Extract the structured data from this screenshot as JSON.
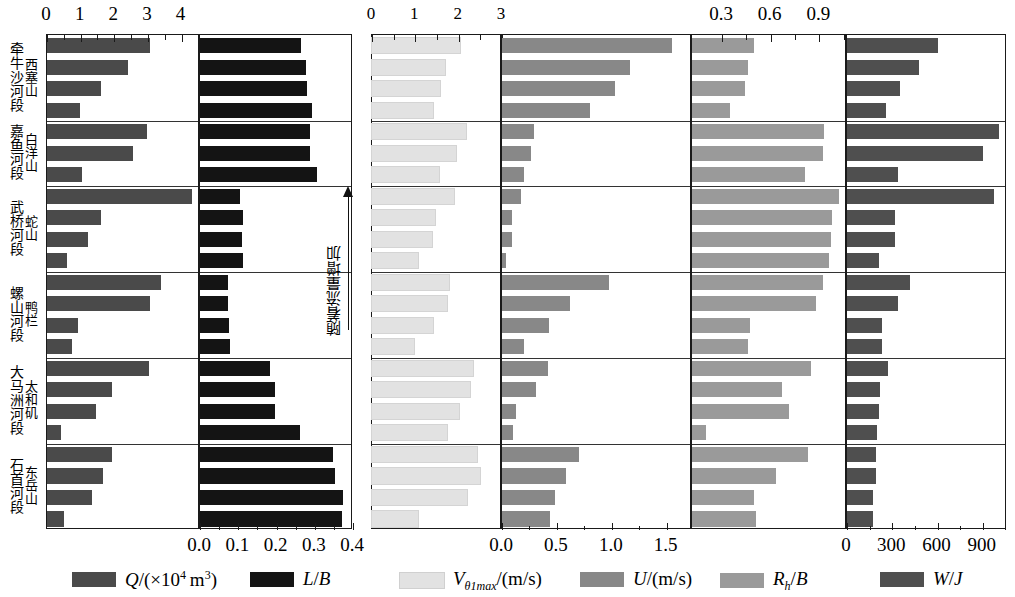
{
  "chart_data": {
    "type": "bar",
    "orientation": "horizontal",
    "title": "",
    "layout": "6 panels side-by-side sharing 6 reach row-groups; 23 discharge-level rows total",
    "grid": false,
    "legend_position": "bottom",
    "annotation": {
      "text": "随着流量增加",
      "meaning": "with increasing discharge",
      "arrow": "up"
    },
    "groups": [
      {
        "reach": "牯牛沙河段",
        "station": "西塞山",
        "rows": 4
      },
      {
        "reach": "嘲广河段",
        "station": "白洋山",
        "rows": 3
      },
      {
        "reach": "武桥河段",
        "station": "蛇山",
        "rows": 4
      },
      {
        "reach": "螺山河段",
        "station": "鸭栏",
        "rows": 4
      },
      {
        "reach": "大马洲河段",
        "station": "太和矶",
        "rows": 4
      },
      {
        "reach": "石首河段",
        "station": "东岳山",
        "rows": 4
      }
    ],
    "panels": [
      {
        "id": "Q",
        "legend": "Q/(×10^4 m^3)",
        "axis_side": "top",
        "ticks": [
          0,
          1,
          2,
          3,
          4
        ],
        "tick_labels": [
          "0",
          "1",
          "2",
          "3",
          "4"
        ],
        "xlim": [
          0,
          4.55
        ],
        "minor_ticks": true,
        "color": "#4a4a4a",
        "values": [
          3.05,
          2.42,
          1.62,
          0.99,
          2.96,
          2.57,
          1.03,
          4.3,
          1.62,
          1.22,
          0.6,
          3.4,
          3.05,
          0.93,
          0.73,
          3.02,
          1.93,
          1.45,
          0.43,
          1.92,
          1.68,
          1.34,
          0.52
        ]
      },
      {
        "id": "L/B",
        "legend": "L/B",
        "axis_side": "bottom",
        "ticks": [
          0.0,
          0.1,
          0.2,
          0.3,
          0.4
        ],
        "tick_labels": [
          "0.0",
          "0.1",
          "0.2",
          "0.3",
          "0.4"
        ],
        "xlim": [
          0,
          0.4
        ],
        "minor_ticks": true,
        "color": "#141414",
        "values": [
          0.265,
          0.276,
          0.28,
          0.292,
          0.288,
          0.288,
          0.307,
          0.105,
          0.112,
          0.11,
          0.113,
          0.073,
          0.072,
          0.076,
          0.079,
          0.183,
          0.195,
          0.197,
          0.262,
          0.348,
          0.352,
          0.374,
          0.37
        ]
      },
      {
        "id": "Vt1max",
        "legend": "V_θ1max/(m/s)",
        "axis_side": "top",
        "ticks": [
          0,
          1,
          2,
          3
        ],
        "tick_labels": [
          "0",
          "1",
          "2",
          "3"
        ],
        "xlim": [
          0,
          3.0
        ],
        "minor_ticks": true,
        "color": "#e2e2e2",
        "values": [
          2.02,
          1.69,
          1.58,
          1.4,
          2.18,
          1.93,
          1.55,
          1.9,
          1.45,
          1.38,
          1.07,
          1.77,
          1.72,
          1.4,
          0.97,
          2.34,
          2.25,
          2.0,
          1.73,
          2.43,
          2.49,
          2.2,
          1.05
        ]
      },
      {
        "id": "U",
        "legend": "U/(m/s)",
        "axis_side": "bottom",
        "ticks": [
          0.0,
          0.5,
          1.0,
          1.5
        ],
        "tick_labels": [
          "0.0",
          "0.5",
          "1.0",
          "1.5"
        ],
        "xlim": [
          0,
          1.73
        ],
        "minor_ticks": true,
        "color": "#888888",
        "values": [
          1.55,
          1.17,
          1.03,
          0.8,
          0.29,
          0.26,
          0.2,
          0.17,
          0.09,
          0.09,
          0.04,
          0.97,
          0.62,
          0.43,
          0.2,
          0.42,
          0.31,
          0.13,
          0.1,
          0.7,
          0.58,
          0.48,
          0.44
        ]
      },
      {
        "id": "Rh/B",
        "legend": "R_h/B",
        "axis_side": "top",
        "ticks": [
          0.3,
          0.6,
          0.9
        ],
        "tick_labels": [
          "0.3",
          "0.6",
          "0.9"
        ],
        "xlim": [
          0.115,
          1.07
        ],
        "minor_ticks": true,
        "color": "#9a9a9a",
        "values": [
          0.5,
          0.46,
          0.44,
          0.35,
          0.93,
          0.92,
          0.81,
          1.02,
          0.98,
          0.97,
          0.96,
          0.92,
          0.88,
          0.47,
          0.46,
          0.85,
          0.67,
          0.71,
          0.2,
          0.83,
          0.63,
          0.5,
          0.51
        ]
      },
      {
        "id": "W/J",
        "legend": "W/J",
        "axis_side": "bottom",
        "ticks": [
          0,
          300,
          600,
          900
        ],
        "tick_labels": [
          "0",
          "300",
          "600",
          "900"
        ],
        "xlim": [
          0,
          1060
        ],
        "minor_ticks": true,
        "color": "#4f4f4f",
        "values": [
          600,
          480,
          350,
          260,
          1010,
          900,
          340,
          975,
          320,
          320,
          215,
          420,
          340,
          230,
          230,
          270,
          220,
          210,
          200,
          190,
          190,
          170,
          175
        ]
      }
    ]
  },
  "axes_top": {
    "panel1": [
      "0",
      "1",
      "2",
      "3",
      "4"
    ],
    "panel3": [
      "0",
      "1",
      "2",
      "3"
    ],
    "panel5": [
      "0.3",
      "0.6",
      "0.9"
    ]
  },
  "axes_bottom": {
    "panel2": [
      "0.0",
      "0.1",
      "0.2",
      "0.3",
      "0.4"
    ],
    "panel4": [
      "0.0",
      "0.5",
      "1.0",
      "1.5"
    ],
    "panel6": [
      "0",
      "300",
      "600",
      "900"
    ]
  },
  "legend": {
    "items": [
      {
        "key": "Q",
        "html": "Q/(×10⁴ m³)",
        "color": "#4a4a4a"
      },
      {
        "key": "LB",
        "html": "L/B",
        "color": "#141414"
      },
      {
        "key": "V",
        "html": "Vθ1max/(m/s)",
        "color": "#e2e2e2"
      },
      {
        "key": "U",
        "html": "U/(m/s)",
        "color": "#888888"
      },
      {
        "key": "RB",
        "html": "Rh/B",
        "color": "#9a9a9a"
      },
      {
        "key": "WJ",
        "html": "W/J",
        "color": "#4f4f4f"
      }
    ]
  },
  "annotation": {
    "text": "随着流量增加"
  },
  "group_labels": [
    {
      "reach": "牵牛沙河段",
      "station": "西塞山"
    },
    {
      "reach": "嘉鱼河段",
      "station": "白洋山"
    },
    {
      "reach": "武桥河段",
      "station": "蛇山"
    },
    {
      "reach": "螺山河段",
      "station": "鸭栏"
    },
    {
      "reach": "大马洲河段",
      "station": "太和矶"
    },
    {
      "reach": "石首河段",
      "station": "东岳山"
    }
  ]
}
